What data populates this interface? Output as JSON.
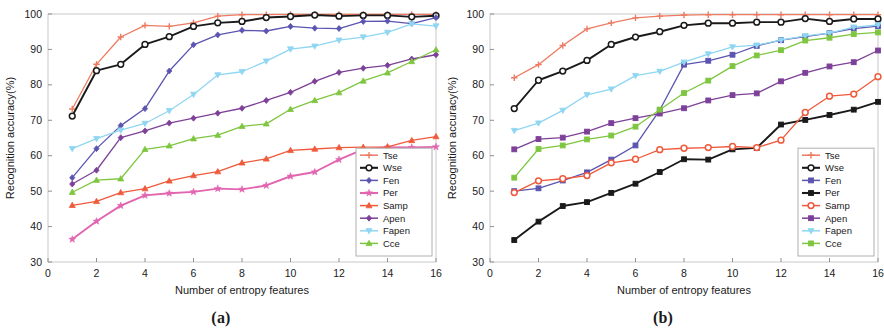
{
  "figure": {
    "panels": [
      {
        "id": "a",
        "caption": "(a)",
        "xlabel": "Number of entropy features",
        "ylabel": "Recognition accuracy(%)",
        "xticks": [
          "0",
          "2",
          "4",
          "6",
          "8",
          "10",
          "12",
          "14",
          "16"
        ],
        "yticks": [
          "30",
          "40",
          "50",
          "60",
          "70",
          "80",
          "90",
          "100"
        ]
      },
      {
        "id": "b",
        "caption": "(b)",
        "xlabel": "Number of entropy features",
        "ylabel": "Recognition accuracy(%)",
        "xticks": [
          "0",
          "2",
          "4",
          "6",
          "8",
          "10",
          "12",
          "14",
          "16"
        ],
        "yticks": [
          "30",
          "40",
          "50",
          "60",
          "70",
          "80",
          "90",
          "100"
        ]
      }
    ]
  },
  "chart_data": [
    {
      "type": "line",
      "panel": "a",
      "title": "(a)",
      "xlabel": "Number of entropy features",
      "ylabel": "Recognition accuracy(%)",
      "xlim": [
        0,
        16
      ],
      "ylim": [
        30,
        100
      ],
      "xticks": [
        0,
        2,
        4,
        6,
        8,
        10,
        12,
        14,
        16
      ],
      "yticks": [
        30,
        40,
        50,
        60,
        70,
        80,
        90,
        100
      ],
      "grid": false,
      "legend_position": "lower right",
      "x": [
        1,
        2,
        3,
        4,
        5,
        6,
        7,
        8,
        9,
        10,
        11,
        12,
        13,
        14,
        15,
        16
      ],
      "series": [
        {
          "name": "Tse",
          "color": "#ED7B62",
          "marker": "plus",
          "values": [
            73.2,
            85.8,
            93.5,
            96.8,
            96.5,
            97.5,
            99.4,
            99.8,
            99.8,
            99.9,
            99.9,
            99.9,
            99.9,
            99.9,
            99.9,
            99.9
          ]
        },
        {
          "name": "Wse",
          "color": "#1a1a1a",
          "marker": "circle",
          "values": [
            71.2,
            84.0,
            85.8,
            91.4,
            93.6,
            96.5,
            97.5,
            97.9,
            99.0,
            99.3,
            99.7,
            99.4,
            99.6,
            99.6,
            99.2,
            99.5
          ]
        },
        {
          "name": "Fen",
          "color": "#5B55B0",
          "marker": "diamond",
          "values": [
            53.8,
            62.0,
            68.5,
            73.3,
            83.9,
            91.3,
            94.1,
            95.4,
            95.2,
            96.5,
            96.0,
            95.9,
            97.9,
            98.0,
            97.3,
            99.0
          ]
        },
        {
          "name": "Per",
          "color": "#E265B0",
          "marker": "star",
          "values": [
            36.4,
            41.5,
            45.9,
            48.8,
            49.4,
            49.8,
            50.7,
            50.5,
            51.6,
            54.2,
            55.4,
            58.9,
            61.8,
            62.4,
            62.3,
            62.5
          ]
        },
        {
          "name": "Samp",
          "color": "#EF5A3C",
          "marker": "triangle",
          "values": [
            46.0,
            47.1,
            49.6,
            50.7,
            52.9,
            54.4,
            55.5,
            58.0,
            59.1,
            61.5,
            61.9,
            62.3,
            62.4,
            62.5,
            64.3,
            65.4
          ]
        },
        {
          "name": "Apen",
          "color": "#7D4098",
          "marker": "diamond",
          "values": [
            52.0,
            55.9,
            65.1,
            67.0,
            69.2,
            70.6,
            72.0,
            73.4,
            75.6,
            77.9,
            81.0,
            83.5,
            84.7,
            85.5,
            87.3,
            88.5
          ]
        },
        {
          "name": "Fapen",
          "color": "#8FD6F2",
          "marker": "triangle-down",
          "values": [
            62.0,
            64.8,
            67.2,
            69.1,
            72.7,
            77.3,
            82.8,
            83.7,
            86.7,
            90.1,
            90.9,
            92.6,
            93.5,
            94.8,
            97.2,
            96.6
          ]
        },
        {
          "name": "Cce",
          "color": "#7FC640",
          "marker": "triangle",
          "values": [
            49.7,
            53.1,
            53.5,
            61.8,
            62.8,
            64.8,
            65.8,
            68.3,
            69.0,
            73.1,
            75.6,
            77.8,
            81.1,
            83.4,
            86.6,
            89.9
          ]
        }
      ]
    },
    {
      "type": "line",
      "panel": "b",
      "title": "(b)",
      "xlabel": "Number of entropy features",
      "ylabel": "Recognition accuracy(%)",
      "xlim": [
        0,
        16
      ],
      "ylim": [
        30,
        100
      ],
      "xticks": [
        0,
        2,
        4,
        6,
        8,
        10,
        12,
        14,
        16
      ],
      "yticks": [
        30,
        40,
        50,
        60,
        70,
        80,
        90,
        100
      ],
      "grid": false,
      "legend_position": "lower right",
      "x": [
        1,
        2,
        3,
        4,
        5,
        6,
        7,
        8,
        9,
        10,
        11,
        12,
        13,
        14,
        15,
        16
      ],
      "series": [
        {
          "name": "Tse",
          "color": "#ED7B62",
          "marker": "plus",
          "values": [
            82.0,
            85.7,
            91.1,
            95.8,
            97.5,
            98.9,
            99.4,
            99.7,
            99.8,
            99.8,
            99.8,
            99.8,
            99.8,
            99.8,
            99.8,
            99.8
          ]
        },
        {
          "name": "Wse",
          "color": "#1a1a1a",
          "marker": "circle",
          "values": [
            73.3,
            81.3,
            83.9,
            86.9,
            91.4,
            93.5,
            95.0,
            96.8,
            97.4,
            97.4,
            97.7,
            97.7,
            98.7,
            97.9,
            98.6,
            98.6
          ]
        },
        {
          "name": "Fen",
          "color": "#5B55B0",
          "marker": "square",
          "values": [
            50.0,
            50.8,
            53.0,
            55.3,
            58.9,
            62.9,
            72.9,
            85.7,
            86.8,
            88.5,
            91.0,
            92.6,
            93.6,
            94.6,
            95.9,
            96.6
          ]
        },
        {
          "name": "Per",
          "color": "#1a1a1a",
          "marker": "square",
          "values": [
            36.2,
            41.4,
            45.8,
            46.9,
            49.5,
            52.1,
            55.4,
            59.0,
            58.9,
            61.8,
            62.2,
            68.8,
            70.1,
            71.5,
            73.0,
            75.2
          ]
        },
        {
          "name": "Samp",
          "color": "#EF5A3C",
          "marker": "circle",
          "values": [
            49.6,
            52.9,
            53.5,
            54.4,
            58.0,
            59.0,
            61.7,
            62.1,
            62.3,
            62.6,
            62.3,
            64.4,
            72.2,
            76.8,
            77.4,
            82.3
          ]
        },
        {
          "name": "Apen",
          "color": "#7D4098",
          "marker": "square",
          "values": [
            61.8,
            64.7,
            65.1,
            66.8,
            69.2,
            70.6,
            71.9,
            73.4,
            75.6,
            77.1,
            77.6,
            81.0,
            83.4,
            85.2,
            86.4,
            89.7
          ]
        },
        {
          "name": "Fapen",
          "color": "#8FD6F2",
          "marker": "triangle-down",
          "values": [
            67.1,
            69.2,
            72.8,
            77.2,
            78.8,
            82.6,
            83.8,
            86.4,
            88.7,
            90.7,
            91.2,
            92.6,
            93.8,
            94.6,
            96.3,
            96.9
          ]
        },
        {
          "name": "Cce",
          "color": "#7FC640",
          "marker": "square",
          "values": [
            53.8,
            61.9,
            62.9,
            64.6,
            65.7,
            68.2,
            73.0,
            77.7,
            81.2,
            85.3,
            88.3,
            89.8,
            92.5,
            93.3,
            94.3,
            94.8
          ]
        }
      ]
    }
  ]
}
